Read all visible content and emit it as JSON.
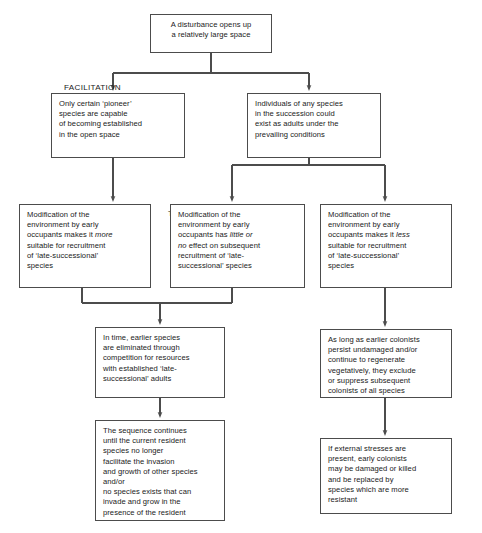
{
  "diagram": {
    "line_color": "#4c4c4c",
    "text_color": "#1a1a1a",
    "background": "#ffffff"
  },
  "branch_labels": [
    {
      "id": "facilitation",
      "text": "FACILITATION"
    },
    {
      "id": "tolerance",
      "text": "TOLERANCE"
    },
    {
      "id": "inhibition",
      "text": "INHIBITION"
    }
  ],
  "nodes": {
    "disturbance": {
      "lines": [
        {
          "text": "A disturbance opens up"
        },
        {
          "text": "a relatively large space"
        }
      ]
    },
    "pioneer": {
      "lines": [
        {
          "text": "Only certain ‘pioneer’"
        },
        {
          "text": "species are capable"
        },
        {
          "text": "of becoming established"
        },
        {
          "text": "in the open space"
        }
      ]
    },
    "any_species": {
      "lines": [
        {
          "text": "Individuals of any species"
        },
        {
          "text": "in the succession could"
        },
        {
          "text": "exist as adults under the"
        },
        {
          "text": "prevailing conditions"
        }
      ]
    },
    "facilitation_effect": {
      "lines": [
        {
          "text": "Modification of the"
        },
        {
          "text": "environment by early"
        },
        {
          "text": "occupants makes it ",
          "em": "more"
        },
        {
          "text": "suitable for recruitment"
        },
        {
          "text": "of ‘late-successional’"
        },
        {
          "text": "species"
        }
      ]
    },
    "tolerance_effect": {
      "lines": [
        {
          "text": "Modification of the"
        },
        {
          "text": "environment by early"
        },
        {
          "text": "occupants has ",
          "em": "little or"
        },
        {
          "em": "no",
          "text_after": " effect on subsequent"
        },
        {
          "text": "recruitment of ‘late-"
        },
        {
          "text": "successional’ species"
        }
      ]
    },
    "inhibition_effect": {
      "lines": [
        {
          "text": "Modification of the"
        },
        {
          "text": "environment by early"
        },
        {
          "text": "occupants makes it ",
          "em": "less"
        },
        {
          "text": "suitable for recruitment"
        },
        {
          "text": "of ‘late-successional’"
        },
        {
          "text": "species"
        }
      ]
    },
    "in_time": {
      "lines": [
        {
          "text": "In time, earlier species"
        },
        {
          "text": "are eliminated through"
        },
        {
          "text": "competition for resources"
        },
        {
          "text": "with established ‘late-"
        },
        {
          "text": "successional’ adults"
        }
      ]
    },
    "sequence_continues": {
      "lines": [
        {
          "text": "The sequence continues"
        },
        {
          "text": "until the current resident"
        },
        {
          "text": "species no longer"
        },
        {
          "text": "facilitate the invasion"
        },
        {
          "text": "and growth of other species"
        },
        {
          "text": "and/or"
        },
        {
          "text": "no species exists that can"
        },
        {
          "text": "invade and grow in the"
        },
        {
          "text": "presence of the resident"
        }
      ]
    },
    "colonists_persist": {
      "lines": [
        {
          "text": "As long as earlier colonists"
        },
        {
          "text": "persist undamaged and/or"
        },
        {
          "text": "continue to regenerate"
        },
        {
          "text": "vegetatively, they exclude"
        },
        {
          "text": "or suppress subsequent"
        },
        {
          "text": "colonists of all species"
        }
      ]
    },
    "external_stresses": {
      "lines": [
        {
          "text": "If external stresses are"
        },
        {
          "text": "present, early colonists"
        },
        {
          "text": "may be damaged or killed"
        },
        {
          "text": "and be replaced by"
        },
        {
          "text": "species which are more"
        },
        {
          "text": "resistant"
        }
      ]
    }
  }
}
